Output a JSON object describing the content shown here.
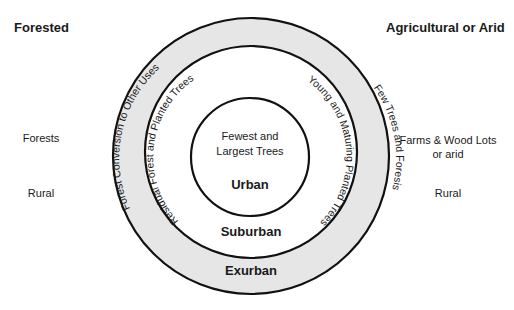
{
  "left_column": {
    "heading": "Forested",
    "vegetation": "Forests",
    "setting": "Rural"
  },
  "right_column": {
    "heading": "Agricultural or Arid",
    "vegetation_line1": "Farms & Wood Lots",
    "vegetation_line2": "or arid",
    "setting": "Rural"
  },
  "rings": {
    "outer": {
      "zone": "Exurban",
      "left_arc_text": "Forest Conversion to Other Uses",
      "right_arc_text": "Few Trees and Foresis",
      "fill": "#e6e6e6"
    },
    "middle": {
      "zone": "Suburban",
      "left_arc_text": "Residual Forest and Planted Trees",
      "right_arc_text": "Young and Maturing Planted Trees",
      "fill": "#ffffff"
    },
    "inner": {
      "zone": "Urban",
      "desc_line1": "Fewest and",
      "desc_line2": "Largest Trees",
      "fill": "#ffffff"
    }
  },
  "colors": {
    "stroke": "#111111",
    "outer_ring_fill": "#e6e6e6",
    "text": "#1a1a1a"
  }
}
